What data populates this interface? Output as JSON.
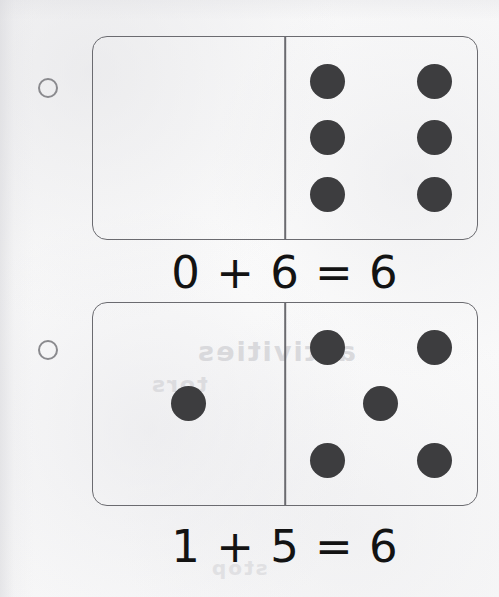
{
  "page": {
    "background_color": "#fcfcfc",
    "ink_color": "#131313",
    "pip_color": "#3d3d3f",
    "tile_outline_color": "#6b6b70",
    "bullet_outline_color": "#8a8a8e",
    "ghost_bleed_text": [
      "activities",
      "tors",
      "stop"
    ]
  },
  "problems": [
    {
      "bullet_label": "",
      "domino": {
        "left_half": {
          "pip_count": 0,
          "pip_positions": []
        },
        "right_half": {
          "pip_count": 6,
          "pip_positions": [
            "p-tl",
            "p-tr",
            "p-ml",
            "p-mr",
            "p-bl",
            "p-br"
          ]
        }
      },
      "equation": "0 + 6 = 6",
      "addend_left": 0,
      "addend_right": 6,
      "sum": 6
    },
    {
      "bullet_label": "",
      "domino": {
        "left_half": {
          "pip_count": 1,
          "pip_positions": [
            "p-mc"
          ]
        },
        "right_half": {
          "pip_count": 5,
          "pip_positions": [
            "p-tl",
            "p-tr",
            "p-mc",
            "p-bl",
            "p-br"
          ]
        }
      },
      "equation": "1 + 5 = 6",
      "addend_left": 1,
      "addend_right": 5,
      "sum": 6
    }
  ]
}
